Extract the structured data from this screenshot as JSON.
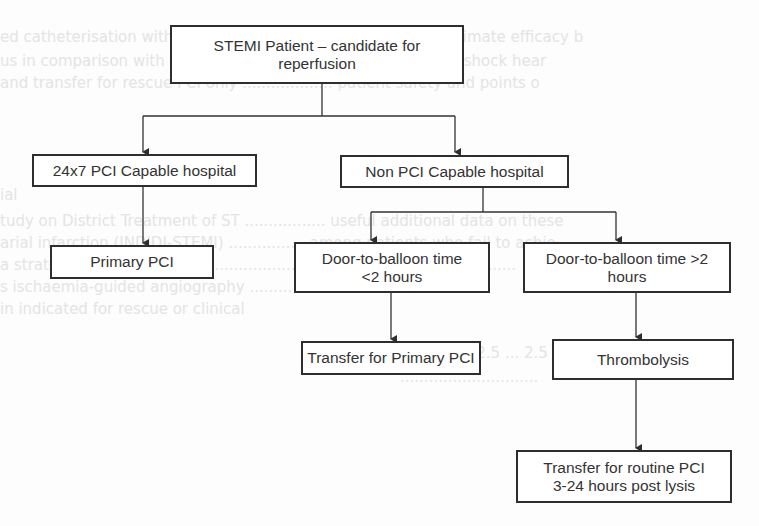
{
  "diagram": {
    "type": "flowchart",
    "colors": {
      "border": "#2e2e2e",
      "text": "#333333",
      "background": "#fdfdfd",
      "ghost_text": "#e4e4e4"
    },
    "nodes": {
      "root": {
        "line1": "STEMI Patient – candidate for",
        "line2": "reperfusion"
      },
      "pci_capable": {
        "label": "24x7 PCI Capable hospital"
      },
      "non_pci_capable": {
        "label": "Non PCI Capable hospital"
      },
      "primary_pci": {
        "label": "Primary PCI"
      },
      "dtb_under_2h": {
        "line1": "Door-to-balloon time",
        "line2": "<2 hours"
      },
      "dtb_over_2h": {
        "line1": "Door-to-balloon time >2",
        "line2": "hours"
      },
      "transfer_primary_pci": {
        "label": "Transfer for Primary PCI"
      },
      "thrombolysis": {
        "label": "Thrombolysis"
      },
      "transfer_routine_pci": {
        "line1": "Transfer for routine PCI",
        "line2": "3-24 hours post lysis"
      }
    },
    "edges": [
      {
        "from": "root",
        "to": "pci_capable"
      },
      {
        "from": "root",
        "to": "non_pci_capable"
      },
      {
        "from": "pci_capable",
        "to": "primary_pci"
      },
      {
        "from": "non_pci_capable",
        "to": "dtb_under_2h"
      },
      {
        "from": "non_pci_capable",
        "to": "dtb_over_2h"
      },
      {
        "from": "dtb_under_2h",
        "to": "transfer_primary_pci"
      },
      {
        "from": "dtb_over_2h",
        "to": "thrombolysis"
      },
      {
        "from": "thrombolysis",
        "to": "transfer_routine_pci"
      }
    ]
  }
}
